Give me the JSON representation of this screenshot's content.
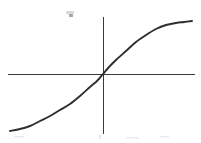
{
  "figure": {
    "kind": "cartesian-axes-plot",
    "background_color": "#ffffff",
    "axis_color": "#3b3b3b",
    "curve_color": "#2e2e2e",
    "width": 201,
    "height": 143,
    "alt_text": "Hand drawn S shaped sigmoid curve crossing the origin of unlabeled x and y axes"
  },
  "axes": {
    "origin": {
      "x": 103,
      "y": 74
    },
    "x_axis": {
      "x_start": 8,
      "x_end": 195,
      "y": 74,
      "has_ticks": false,
      "has_arrowheads": false,
      "label": ""
    },
    "y_axis": {
      "y_start": 17,
      "y_end": 134,
      "x": 103,
      "has_ticks": false,
      "has_arrowheads": false,
      "label": ""
    }
  },
  "artifacts": [
    {
      "name": "pencil-smudge",
      "x": 68,
      "y": 13,
      "width": 7,
      "height": 5
    },
    {
      "name": "scan-speck-left",
      "x": 14,
      "y": 136,
      "width": 10,
      "height": 2
    },
    {
      "name": "scan-speck-center",
      "x": 99,
      "y": 136,
      "width": 3,
      "height": 4
    },
    {
      "name": "scan-speck-right",
      "x": 126,
      "y": 137,
      "width": 13,
      "height": 2
    }
  ],
  "chart_data": {
    "type": "line",
    "title": "",
    "subtitle": "",
    "xlabel": "",
    "ylabel": "",
    "grid": false,
    "legend": null,
    "legend_position": "none",
    "tick_labels_x": [],
    "tick_labels_y": [],
    "xlim": [
      -1,
      1
    ],
    "ylim": [
      -1,
      1
    ],
    "annotations": [],
    "series": [
      {
        "name": "sigmoid",
        "shape": "S-curve, odd symmetric about the origin, monotonically increasing with horizontal asymptotes",
        "x": [
          -1.0,
          -0.9,
          -0.8,
          -0.7,
          -0.6,
          -0.5,
          -0.4,
          -0.3,
          -0.2,
          -0.1,
          0.0,
          0.1,
          0.2,
          0.3,
          0.4,
          0.5,
          0.6,
          0.7,
          0.8,
          0.9,
          1.0
        ],
        "y": [
          -0.96,
          -0.93,
          -0.89,
          -0.84,
          -0.78,
          -0.7,
          -0.6,
          -0.47,
          -0.33,
          -0.17,
          0.0,
          0.17,
          0.33,
          0.47,
          0.6,
          0.7,
          0.78,
          0.84,
          0.89,
          0.93,
          0.96
        ],
        "pixel_points": [
          {
            "x": 10,
            "y": 131
          },
          {
            "x": 20,
            "y": 129
          },
          {
            "x": 30,
            "y": 126
          },
          {
            "x": 40,
            "y": 121
          },
          {
            "x": 50,
            "y": 116
          },
          {
            "x": 60,
            "y": 110
          },
          {
            "x": 70,
            "y": 104
          },
          {
            "x": 80,
            "y": 96
          },
          {
            "x": 90,
            "y": 87
          },
          {
            "x": 97,
            "y": 81
          },
          {
            "x": 103,
            "y": 74
          },
          {
            "x": 109,
            "y": 67
          },
          {
            "x": 116,
            "y": 60
          },
          {
            "x": 126,
            "y": 51
          },
          {
            "x": 136,
            "y": 42
          },
          {
            "x": 146,
            "y": 35
          },
          {
            "x": 156,
            "y": 29
          },
          {
            "x": 166,
            "y": 25
          },
          {
            "x": 176,
            "y": 23
          },
          {
            "x": 184,
            "y": 22
          },
          {
            "x": 192,
            "y": 21
          }
        ]
      }
    ]
  }
}
